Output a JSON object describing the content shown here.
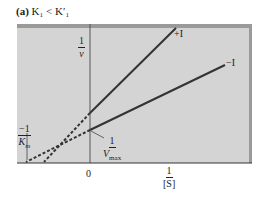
{
  "title": {
    "part": "(a)",
    "text": "K₁ < K′₁"
  },
  "labels": {
    "y_axis_num": "1",
    "y_axis_den": "v",
    "x_axis_num": "1",
    "x_axis_den": "[S]",
    "origin": "0",
    "km_num": "−1",
    "km_den": "K",
    "km_sub": "m",
    "vmax_num": "1",
    "vmax_den": "V",
    "vmax_sub": "max",
    "plus_i": "+I",
    "minus_i": "−I"
  },
  "colors": {
    "panel": "#d4d4d4",
    "frame": "#9a9a9a",
    "line": "#333333"
  }
}
